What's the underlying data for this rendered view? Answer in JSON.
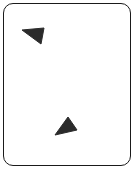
{
  "card": {
    "background": "#ffffff",
    "border_color": "#1a1a1a",
    "shapes": [
      {
        "name": "triangle-top-left",
        "icon": "triangle-icon",
        "fill": "#2b2b2b",
        "points": "22,30 44,28 41,44"
      },
      {
        "name": "triangle-bottom-center",
        "icon": "triangle-icon",
        "fill": "#2b2b2b",
        "points": "55,135 68,117 77,130"
      }
    ]
  }
}
